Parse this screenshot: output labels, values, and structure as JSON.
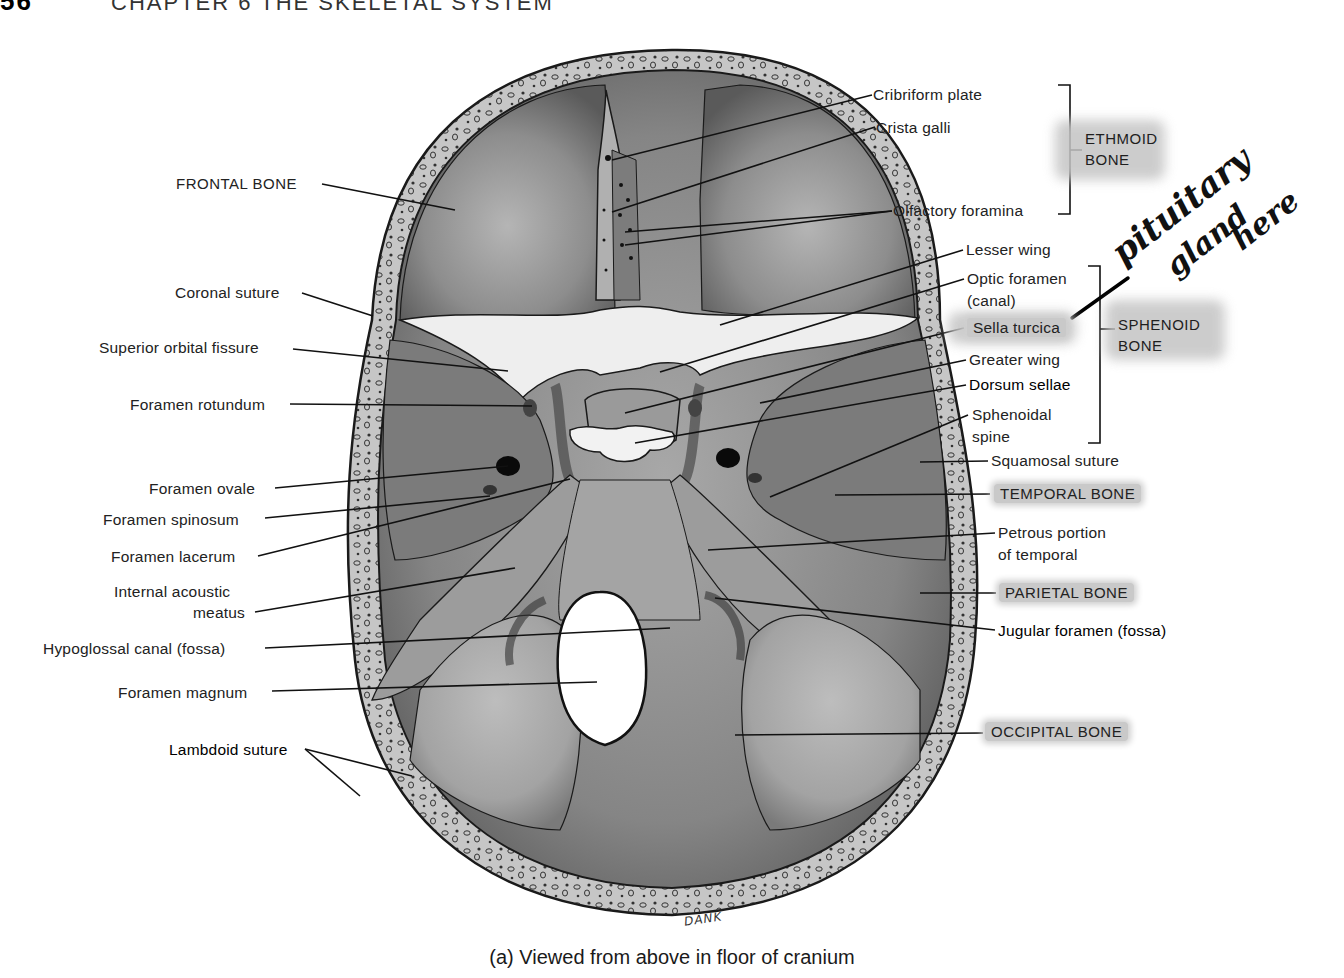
{
  "header": {
    "page_number": "56",
    "chapter": "CHAPTER 6  THE SKELETAL SYSTEM"
  },
  "caption": "(a) Viewed from above in floor of cranium",
  "artist_signature": "DANK",
  "handwritten_note": {
    "lines": [
      "pituitary",
      "gland",
      "here"
    ],
    "points_to": "Sella turcica"
  },
  "left_labels": [
    {
      "id": "frontal-bone",
      "text": "FRONTAL BONE",
      "x": 176,
      "y": 173,
      "caps": true
    },
    {
      "id": "coronal-suture",
      "text": "Coronal suture",
      "x": 175,
      "y": 282
    },
    {
      "id": "superior-orbital-fissure",
      "text": "Superior orbital fissure",
      "x": 99,
      "y": 337
    },
    {
      "id": "foramen-rotundum",
      "text": "Foramen rotundum",
      "x": 130,
      "y": 394
    },
    {
      "id": "foramen-ovale",
      "text": "Foramen ovale",
      "x": 149,
      "y": 478
    },
    {
      "id": "foramen-spinosum",
      "text": "Foramen spinosum",
      "x": 103,
      "y": 509
    },
    {
      "id": "foramen-lacerum",
      "text": "Foramen lacerum",
      "x": 111,
      "y": 546
    },
    {
      "id": "internal-acoustic-meatus-1",
      "text": "Internal acoustic",
      "x": 114,
      "y": 581
    },
    {
      "id": "internal-acoustic-meatus-2",
      "text": "meatus",
      "x": 193,
      "y": 602
    },
    {
      "id": "hypoglossal-canal",
      "text": "Hypoglossal canal (fossa)",
      "x": 43,
      "y": 638
    },
    {
      "id": "foramen-magnum",
      "text": "Foramen magnum",
      "x": 118,
      "y": 682
    },
    {
      "id": "lambdoid-suture",
      "text": "Lambdoid suture",
      "x": 169,
      "y": 739,
      "bold": true
    }
  ],
  "right_labels": [
    {
      "id": "cribriform-plate",
      "text": "Cribriform plate",
      "x": 873,
      "y": 84
    },
    {
      "id": "crista-galli",
      "text": "Crista galli",
      "x": 876,
      "y": 117
    },
    {
      "id": "olfactory-foramina",
      "text": "Olfactory foramina",
      "x": 893,
      "y": 200
    },
    {
      "id": "lesser-wing",
      "text": "Lesser wing",
      "x": 966,
      "y": 239
    },
    {
      "id": "optic-foramen-1",
      "text": "Optic foramen",
      "x": 967,
      "y": 268
    },
    {
      "id": "optic-foramen-2",
      "text": "(canal)",
      "x": 967,
      "y": 290
    },
    {
      "id": "sella-turcica",
      "text": "Sella turcica",
      "x": 967,
      "y": 317,
      "highlight": true
    },
    {
      "id": "greater-wing",
      "text": "Greater wing",
      "x": 969,
      "y": 349
    },
    {
      "id": "dorsum-sellae",
      "text": "Dorsum sellae",
      "x": 969,
      "y": 374,
      "bold": true
    },
    {
      "id": "sphenoidal-spine-1",
      "text": "Sphenoidal",
      "x": 972,
      "y": 404
    },
    {
      "id": "sphenoidal-spine-2",
      "text": "spine",
      "x": 972,
      "y": 426
    },
    {
      "id": "squamosal-suture",
      "text": "Squamosal suture",
      "x": 991,
      "y": 450
    },
    {
      "id": "temporal-bone",
      "text": "TEMPORAL BONE",
      "x": 994,
      "y": 483,
      "caps": true,
      "highlight": true
    },
    {
      "id": "petrous-portion-1",
      "text": "Petrous portion",
      "x": 998,
      "y": 522
    },
    {
      "id": "petrous-portion-2",
      "text": "of temporal",
      "x": 998,
      "y": 544
    },
    {
      "id": "parietal-bone",
      "text": "PARIETAL BONE",
      "x": 999,
      "y": 582,
      "caps": true,
      "highlight": true
    },
    {
      "id": "jugular-foramen",
      "text": "Jugular foramen (fossa)",
      "x": 998,
      "y": 620,
      "bold": true
    },
    {
      "id": "occipital-bone",
      "text": "OCCIPITAL BONE",
      "x": 985,
      "y": 721,
      "caps": true,
      "highlight": true
    }
  ],
  "bone_groups": [
    {
      "id": "ethmoid-bone",
      "line1": "ETHMOID",
      "line2": "BONE",
      "x": 1085,
      "y": 128
    },
    {
      "id": "sphenoid-bone",
      "line1": "SPHENOID",
      "line2": "BONE",
      "x": 1118,
      "y": 314
    }
  ],
  "colors": {
    "skull_fill": "#8f8f8f",
    "skull_dark": "#5e5e5e",
    "bone_rim": "#c3c3c3",
    "highlight": "#c9c9c9",
    "outline": "#1a1a1a"
  }
}
